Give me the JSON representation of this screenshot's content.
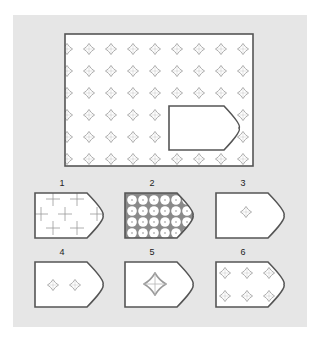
{
  "puzzle": {
    "type": "pattern-completion",
    "description": "Large rectangle filled with a grid of gray four-petal flower motifs; a pentagonal tag-shaped piece is cut out. Choose which option fills the gap.",
    "colors": {
      "background": "#ffffff",
      "panel": "#e6e6e6",
      "frame_fill": "#ffffff",
      "stroke": "#555555",
      "motif": "#9a9a9a"
    },
    "main": {
      "motif": "four-petal-flower",
      "rows": 6,
      "cols": 9
    },
    "options": [
      {
        "label": "1",
        "pattern": "plus-signs",
        "count": 8
      },
      {
        "label": "2",
        "pattern": "dense-circles-grid",
        "count": 20
      },
      {
        "label": "3",
        "pattern": "single-small-flower",
        "count": 1
      },
      {
        "label": "4",
        "pattern": "two-small-flowers",
        "count": 2
      },
      {
        "label": "5",
        "pattern": "single-large-flower",
        "count": 1
      },
      {
        "label": "6",
        "pattern": "six-small-flowers",
        "count": 6
      }
    ]
  }
}
